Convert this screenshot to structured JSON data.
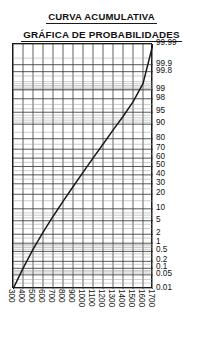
{
  "title": {
    "line1": "CURVA ACUMULATIVA",
    "line2": "GRÁFICA DE PROBABILIDADES"
  },
  "colors": {
    "curve": "#1a1a1a",
    "grid_major": "#3a3a3a",
    "grid_minor": "#9a9a9a",
    "border": "#1b1b1b",
    "text": "#111111",
    "background": "#ffffff"
  },
  "chart_data": {
    "type": "line",
    "title": "CURVA ACUMULATIVA GRÁFICA DE PROBABILIDADES",
    "xlabel": "",
    "ylabel": "",
    "grid": true,
    "legend": "none",
    "x_scale": "linear",
    "y_scale": "probability",
    "xlim": [
      300,
      1700
    ],
    "ylim": [
      0.01,
      99.99
    ],
    "x_ticks": [
      300,
      400,
      500,
      600,
      700,
      800,
      900,
      1000,
      1100,
      1200,
      1300,
      1400,
      1500,
      1600,
      1700
    ],
    "x_tick_labels": [
      "300",
      "400",
      "500",
      "600",
      "700",
      "800",
      "900",
      "1000",
      "1100",
      "1200",
      "1300",
      "1400",
      "1500",
      "1600",
      "1700"
    ],
    "y_ticks": [
      99.99,
      99.9,
      99.8,
      99,
      98,
      95,
      90,
      80,
      70,
      60,
      50,
      40,
      30,
      20,
      10,
      5,
      2,
      1,
      0.5,
      0.2,
      0.1,
      0.05,
      0.01
    ],
    "y_tick_labels": [
      "99.99",
      "99.9",
      "99.8",
      "99",
      "98",
      "95",
      "90",
      "80",
      "70",
      "60",
      "50",
      "40",
      "30",
      "20",
      "10",
      "5",
      "2",
      "1",
      "0.5",
      "0.2",
      "0.1",
      "0.05",
      "0.01"
    ],
    "series": [
      {
        "name": "Curva acumulativa",
        "x": [
          300,
          400,
          500,
          600,
          700,
          800,
          900,
          1000,
          1100,
          1200,
          1300,
          1400,
          1500,
          1600,
          1700
        ],
        "y": [
          0.01,
          0.1,
          0.6,
          2.3,
          6.5,
          14.5,
          27.0,
          43.0,
          60.0,
          75.0,
          86.5,
          93.5,
          97.5,
          99.4,
          99.99
        ]
      }
    ]
  }
}
